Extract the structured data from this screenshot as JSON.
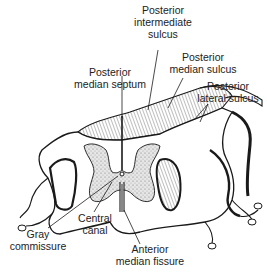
{
  "figure": {
    "colors": {
      "line": "#1a1a1a",
      "gray_matter_fill": "#d9d9d9",
      "background": "#ffffff"
    },
    "labels": {
      "posterior_intermediate_sulcus": {
        "line1": "Posterior",
        "line2": "intermediate",
        "line3": "sulcus"
      },
      "posterior_median_sulcus": {
        "line1": "Posterior",
        "line2": "median sulcus"
      },
      "posterior_median_septum": {
        "line1": "Posterior",
        "line2": "median septum"
      },
      "posterior_lateral_sulcus": {
        "line1": "Posterior",
        "line2": "lateral sulcus"
      },
      "gray_commissure": {
        "line1": "Gray",
        "line2": "commissure"
      },
      "central_canal": {
        "line1": "Central",
        "line2": "canal"
      },
      "anterior_median_fissure": {
        "line1": "Anterior",
        "line2": "median fissure"
      }
    }
  }
}
